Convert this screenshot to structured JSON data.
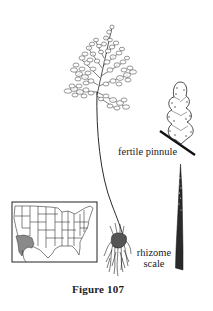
{
  "figure": {
    "caption": "Figure 107",
    "labels": {
      "fertile_pinnule": "fertile pinnule",
      "rhizome_scale_line1": "rhizome",
      "rhizome_scale_line2": "scale"
    },
    "illustrations": [
      {
        "name": "fern-frond",
        "description": "finely divided triangular fern frond on long slender stipe"
      },
      {
        "name": "fertile-pinnule",
        "description": "enlarged lobed pinnule with marginal sori, attached to rachis"
      },
      {
        "name": "rhizome-roots",
        "description": "tuft of fibrous roots at base of stipe"
      },
      {
        "name": "rhizome-scale",
        "description": "long narrow tapering dark scale"
      },
      {
        "name": "distribution-map",
        "description": "outline map of contiguous United States with shaded range in southwestern region (southern California / Arizona)"
      }
    ],
    "colors": {
      "ink": "#1a1a1a",
      "map_shade": "#8a8a8a",
      "background": "#ffffff"
    }
  }
}
